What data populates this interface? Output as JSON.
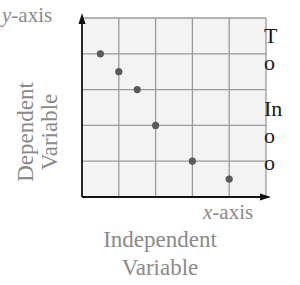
{
  "labels": {
    "y_axis_var": "y",
    "y_axis_suffix": "-axis",
    "x_axis_var": "x",
    "x_axis_suffix": "-axis",
    "dependent_line1": "Dependent",
    "dependent_line2": "Variable",
    "independent_line1": "Independent",
    "independent_line2": "Variable"
  },
  "side_text": {
    "p1_line1": "T",
    "p1_line2": "o",
    "p2_line1": "In",
    "p2_line2": "o",
    "p2_line3": "o"
  },
  "colors": {
    "grid": "#9a9a9a",
    "points": "#5a5a5a",
    "axes": "#111111",
    "labels": "#8a8a8a",
    "background_plot": "#f3f3f3"
  },
  "chart_data": {
    "type": "scatter",
    "title": "",
    "xlabel": "x-axis (Independent Variable)",
    "ylabel": "y-axis (Dependent Variable)",
    "xlim": [
      0,
      5
    ],
    "ylim": [
      0,
      5
    ],
    "grid": true,
    "x": [
      0.5,
      1.0,
      1.5,
      2.0,
      3.0,
      4.0
    ],
    "y": [
      4.0,
      3.5,
      3.0,
      2.0,
      1.0,
      0.5
    ]
  }
}
